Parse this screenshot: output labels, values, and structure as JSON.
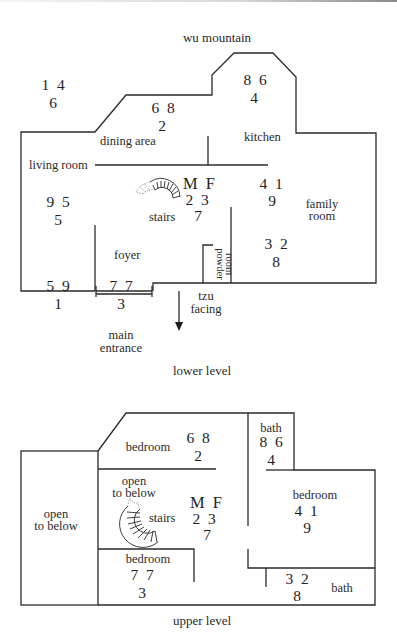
{
  "top_label": "wu mountain",
  "outside_star": {
    "top": "1  4",
    "bottom": "6"
  },
  "lower_level": {
    "caption": "lower level",
    "rooms": {
      "living_room": "living room",
      "dining_area": "dining area",
      "kitchen": "kitchen",
      "stairs": "stairs",
      "foyer": "foyer",
      "family_room_1": "family",
      "family_room_2": "room",
      "powder_room_1": "powder",
      "powder_room_2": "room",
      "main_entrance_1": "main",
      "main_entrance_2": "entrance",
      "tzu_1": "tzu",
      "tzu_2": "facing"
    },
    "stars": {
      "dining": {
        "top": "6  8",
        "bottom": "2"
      },
      "kitchen": {
        "top": "8  6",
        "bottom": "4"
      },
      "living": {
        "top": "9  5",
        "bottom": "5"
      },
      "center": {
        "label": "M  F",
        "top": "2  3",
        "bottom": "7"
      },
      "family_n": {
        "top": "4  1",
        "bottom": "9"
      },
      "family_s": {
        "top": "3  2",
        "bottom": "8"
      },
      "sw": {
        "top": "5  9",
        "bottom": "1"
      },
      "foyer": {
        "top": "7  7",
        "bottom": "3"
      }
    }
  },
  "upper_level": {
    "caption": "upper level",
    "rooms": {
      "open_left_1": "open",
      "open_left_2": "to below",
      "bedroom_n": "bedroom",
      "open_center_1": "open",
      "open_center_2": "to below",
      "stairs": "stairs",
      "bedroom_sw": "bedroom",
      "bath_n": "bath",
      "bedroom_e": "bedroom",
      "bath_s": "bath"
    },
    "stars": {
      "bedroom_n": {
        "top": "6  8",
        "bottom": "2"
      },
      "bath_n": {
        "top": "8  6",
        "bottom": "4"
      },
      "center": {
        "label": "M  F",
        "top": "2  3",
        "bottom": "7"
      },
      "bedroom_e": {
        "top": "4  1",
        "bottom": "9"
      },
      "bedroom_sw": {
        "top": "7  7",
        "bottom": "3"
      },
      "bath_s": {
        "top": "3  2",
        "bottom": "8"
      }
    }
  }
}
